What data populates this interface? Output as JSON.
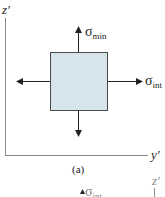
{
  "figure_a": {
    "vertical_axis_label": "z′",
    "horizontal_axis_label": "y′",
    "caption": "(a)",
    "element_fill": "#d6e4ec",
    "stresses": {
      "top": {
        "symbol": "σ",
        "subscript": "min"
      },
      "right": {
        "symbol": "σ",
        "subscript": "int"
      }
    }
  },
  "figure_b_partial": {
    "vertical_axis_label": "z′",
    "stress": {
      "symbol": "σ",
      "subscript": "int"
    }
  }
}
